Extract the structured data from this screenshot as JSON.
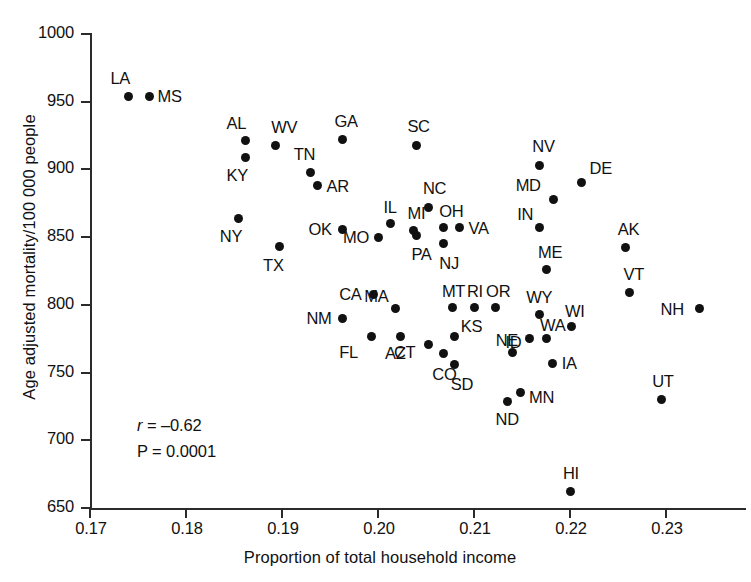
{
  "chart_data": {
    "type": "scatter",
    "title": "",
    "xlabel": "Proportion of total household income",
    "ylabel": "Age adjusted mortality/100 000 people",
    "xlim": [
      0.17,
      0.2335
    ],
    "ylim": [
      650,
      1000
    ],
    "xticks": [
      "0.17",
      "0.18",
      "0.19",
      "0.20",
      "0.21",
      "0.22",
      "0.23"
    ],
    "xtick_values": [
      0.17,
      0.18,
      0.19,
      0.2,
      0.21,
      0.22,
      0.23
    ],
    "yticks": [
      "650",
      "700",
      "750",
      "800",
      "850",
      "900",
      "950",
      "1000"
    ],
    "ytick_values": [
      650,
      700,
      750,
      800,
      850,
      900,
      950,
      1000
    ],
    "grid": false,
    "legend": null,
    "point_label_position": "per-point",
    "annotations": {
      "correlation_label": "r",
      "correlation_equals": "= –0.62",
      "correlation_value": -0.62,
      "pvalue_text": "P = 0.0001",
      "pvalue": 0.0001
    },
    "points": [
      {
        "label": "LA",
        "x": 0.174,
        "y": 954,
        "lx": -18,
        "ly": -26
      },
      {
        "label": "MS",
        "x": 0.1762,
        "y": 954,
        "lx": 8,
        "ly": -8
      },
      {
        "label": "AL",
        "x": 0.1862,
        "y": 921,
        "lx": -19,
        "ly": -26
      },
      {
        "label": "KY",
        "x": 0.1862,
        "y": 909,
        "lx": -19,
        "ly": 10
      },
      {
        "label": "WV",
        "x": 0.1893,
        "y": 918,
        "lx": -4,
        "ly": -26
      },
      {
        "label": "TN",
        "x": 0.193,
        "y": 898,
        "lx": -17,
        "ly": -26
      },
      {
        "label": "AR",
        "x": 0.1937,
        "y": 888,
        "lx": 9,
        "ly": -8
      },
      {
        "label": "GA",
        "x": 0.1963,
        "y": 922,
        "lx": -8,
        "ly": -27
      },
      {
        "label": "SC",
        "x": 0.204,
        "y": 918,
        "lx": -9,
        "ly": -27
      },
      {
        "label": "NY",
        "x": 0.1855,
        "y": 864,
        "lx": -19,
        "ly": 10
      },
      {
        "label": "TX",
        "x": 0.1897,
        "y": 843,
        "lx": -16,
        "ly": 10
      },
      {
        "label": "OK",
        "x": 0.1963,
        "y": 856,
        "lx": -34,
        "ly": -8
      },
      {
        "label": "MO",
        "x": 0.2,
        "y": 850,
        "lx": -35,
        "ly": -8
      },
      {
        "label": "IL",
        "x": 0.2013,
        "y": 860,
        "lx": -7,
        "ly": -25
      },
      {
        "label": "MI",
        "x": 0.2037,
        "y": 855,
        "lx": -6,
        "ly": -25
      },
      {
        "label": "PA",
        "x": 0.204,
        "y": 851,
        "lx": -5,
        "ly": 10
      },
      {
        "label": "NC",
        "x": 0.2053,
        "y": 872,
        "lx": -6,
        "ly": -27
      },
      {
        "label": "OH",
        "x": 0.2068,
        "y": 857,
        "lx": -4,
        "ly": -25
      },
      {
        "label": "NJ",
        "x": 0.2068,
        "y": 845,
        "lx": -4,
        "ly": 11
      },
      {
        "label": "VA",
        "x": 0.2085,
        "y": 857,
        "lx": 9,
        "ly": -8
      },
      {
        "label": "NV",
        "x": 0.2168,
        "y": 903,
        "lx": -7,
        "ly": -27
      },
      {
        "label": "MD",
        "x": 0.2183,
        "y": 878,
        "lx": -38,
        "ly": -22
      },
      {
        "label": "DE",
        "x": 0.2212,
        "y": 890,
        "lx": 8,
        "ly": -23
      },
      {
        "label": "IN",
        "x": 0.2168,
        "y": 857,
        "lx": -22,
        "ly": -22
      },
      {
        "label": "AK",
        "x": 0.2258,
        "y": 842,
        "lx": -8,
        "ly": -27
      },
      {
        "label": "ME",
        "x": 0.2175,
        "y": 826,
        "lx": -8,
        "ly": -26
      },
      {
        "label": "VT",
        "x": 0.2262,
        "y": 809,
        "lx": -6,
        "ly": -27
      },
      {
        "label": "CA",
        "x": 0.1995,
        "y": 808,
        "lx": -34,
        "ly": -8
      },
      {
        "label": "MA",
        "x": 0.2018,
        "y": 797,
        "lx": -31,
        "ly": -21
      },
      {
        "label": "NM",
        "x": 0.1963,
        "y": 790,
        "lx": -36,
        "ly": -8
      },
      {
        "label": "MT",
        "x": 0.2078,
        "y": 798,
        "lx": -11,
        "ly": -25
      },
      {
        "label": "RI",
        "x": 0.21,
        "y": 798,
        "lx": -7,
        "ly": -25
      },
      {
        "label": "OR",
        "x": 0.2122,
        "y": 798,
        "lx": -9,
        "ly": -25
      },
      {
        "label": "WY",
        "x": 0.2168,
        "y": 793,
        "lx": -13,
        "ly": -25
      },
      {
        "label": "WI",
        "x": 0.2202,
        "y": 784,
        "lx": -7,
        "ly": -24
      },
      {
        "label": "NH",
        "x": 0.2335,
        "y": 797,
        "lx": -39,
        "ly": -8
      },
      {
        "label": "FL",
        "x": 0.1993,
        "y": 777,
        "lx": -32,
        "ly": 8
      },
      {
        "label": "AZ",
        "x": 0.2023,
        "y": 777,
        "lx": -15,
        "ly": 9
      },
      {
        "label": "CT",
        "x": 0.2053,
        "y": 771,
        "lx": -35,
        "ly": 0
      },
      {
        "label": "KS",
        "x": 0.208,
        "y": 777,
        "lx": 6,
        "ly": -18
      },
      {
        "label": "NE",
        "x": 0.2158,
        "y": 775,
        "lx": -34,
        "ly": -7
      },
      {
        "label": "WA",
        "x": 0.2175,
        "y": 775,
        "lx": -6,
        "ly": -22
      },
      {
        "label": "CO",
        "x": 0.2068,
        "y": 764,
        "lx": -11,
        "ly": 12
      },
      {
        "label": "SD",
        "x": 0.208,
        "y": 756,
        "lx": -4,
        "ly": 12
      },
      {
        "label": "ID",
        "x": 0.214,
        "y": 765,
        "lx": -7,
        "ly": -18
      },
      {
        "label": "IA",
        "x": 0.2182,
        "y": 757,
        "lx": 9,
        "ly": -8
      },
      {
        "label": "MN",
        "x": 0.2148,
        "y": 735,
        "lx": 9,
        "ly": -4
      },
      {
        "label": "ND",
        "x": 0.2135,
        "y": 729,
        "lx": -12,
        "ly": 10
      },
      {
        "label": "UT",
        "x": 0.2295,
        "y": 730,
        "lx": -9,
        "ly": -27
      },
      {
        "label": "HI",
        "x": 0.22,
        "y": 662,
        "lx": -7,
        "ly": -27
      }
    ]
  }
}
